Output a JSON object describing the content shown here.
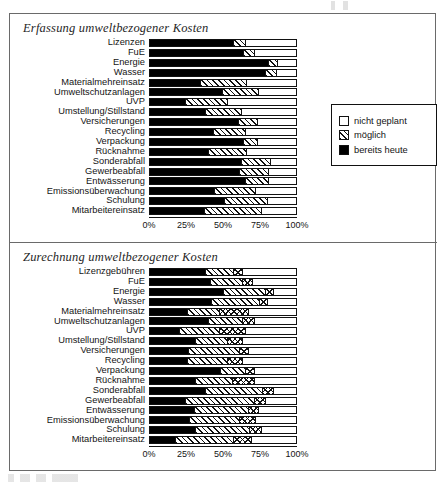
{
  "document": {
    "frame": "scanned-figure-border",
    "accent_color": "#000000",
    "paper_color": "#ffffff"
  },
  "charts": [
    {
      "id": "erfassung",
      "title": "Erfassung umweltbezogener Kosten",
      "legend": {
        "position": "right",
        "items": [
          {
            "label": "nicht geplant",
            "fill": "empty"
          },
          {
            "label": "möglich",
            "fill": "hatch"
          },
          {
            "label": "bereits heute",
            "fill": "solid"
          }
        ]
      },
      "axis": {
        "ticks": [
          "0%",
          "25%",
          "50%",
          "75%",
          "100%"
        ],
        "values": [
          0,
          25,
          50,
          75,
          100
        ]
      }
    },
    {
      "id": "zurechnung",
      "title": "Zurechnung  umweltbezogener Kosten",
      "legend": {
        "position": "right",
        "items": [
          {
            "label": "nicht geplant",
            "fill": "empty"
          },
          {
            "label": "bisher noch nicht",
            "fill": "cross"
          },
          {
            "label": "pauschal",
            "fill": "hatch"
          },
          {
            "label": "verursachungsgerecht",
            "fill": "solid"
          }
        ]
      },
      "axis": {
        "ticks": [
          "0%",
          "25%",
          "50%",
          "75%",
          "100%"
        ],
        "values": [
          0,
          25,
          50,
          75,
          100
        ]
      }
    }
  ],
  "chart_data": [
    {
      "type": "bar",
      "orientation": "horizontal",
      "stacked": true,
      "stacked_percent": true,
      "title": "Erfassung umweltbezogener Kosten",
      "xlabel": "",
      "ylabel": "",
      "xlim": [
        0,
        100
      ],
      "grid": false,
      "legend_position": "right",
      "tick_labels": [
        "0%",
        "25%",
        "50%",
        "75%",
        "100%"
      ],
      "categories": [
        "Lizenzen",
        "FuE",
        "Energie",
        "Wasser",
        "Materialmehreinsatz",
        "Umweltschutzanlagen",
        "UVP",
        "Umstellung/Stillstand",
        "Versicherungen",
        "Recycling",
        "Verpackung",
        "Rücknahme",
        "Sonderabfall",
        "Gewerbeabfall",
        "Entwässerung",
        "Emissionsüberwachung",
        "Schulung",
        "Mitarbeitereinsatz"
      ],
      "series": [
        {
          "name": "bereits heute",
          "fill": "solid",
          "values": [
            57,
            64,
            81,
            79,
            34,
            49,
            24,
            38,
            60,
            43,
            64,
            40,
            62,
            61,
            65,
            44,
            51,
            37
          ]
        },
        {
          "name": "möglich",
          "fill": "hatch",
          "values": [
            8,
            7,
            6,
            7,
            32,
            25,
            29,
            24,
            13,
            22,
            9,
            26,
            20,
            20,
            16,
            28,
            29,
            39
          ]
        },
        {
          "name": "nicht geplant",
          "fill": "empty",
          "values": [
            35,
            29,
            13,
            14,
            34,
            26,
            47,
            38,
            27,
            35,
            27,
            34,
            18,
            19,
            19,
            28,
            20,
            24
          ]
        }
      ]
    },
    {
      "type": "bar",
      "orientation": "horizontal",
      "stacked": true,
      "stacked_percent": true,
      "title": "Zurechnung  umweltbezogener Kosten",
      "xlabel": "",
      "ylabel": "",
      "xlim": [
        0,
        100
      ],
      "grid": false,
      "legend_position": "right",
      "tick_labels": [
        "0%",
        "25%",
        "50%",
        "75%",
        "100%"
      ],
      "categories": [
        "Lizenzgebühren",
        "FuE",
        "Energie",
        "Wasser",
        "Materialmehreinsatz",
        "Umweltschutzanlagen",
        "UVP",
        "Umstellung/Stillstand",
        "Versicherungen",
        "Recycling",
        "Verpackung",
        "Rücknahme",
        "Sonderabfall",
        "Gewerbeabfall",
        "Entwässerung",
        "Emissionsüberwachung",
        "Schulung",
        "Mitarbeitereinsatz"
      ],
      "series": [
        {
          "name": "verursachungsgerecht",
          "fill": "solid",
          "values": [
            38,
            41,
            50,
            42,
            25,
            40,
            20,
            31,
            26,
            25,
            48,
            31,
            38,
            24,
            30,
            27,
            31,
            17
          ]
        },
        {
          "name": "pauschal",
          "fill": "hatch",
          "values": [
            19,
            22,
            29,
            33,
            22,
            23,
            27,
            22,
            35,
            28,
            17,
            25,
            39,
            47,
            37,
            34,
            37,
            40
          ]
        },
        {
          "name": "bisher noch nicht",
          "fill": "cross",
          "values": [
            6,
            7,
            5,
            5,
            20,
            8,
            18,
            10,
            6,
            10,
            6,
            15,
            7,
            8,
            7,
            11,
            8,
            12
          ]
        },
        {
          "name": "nicht geplant",
          "fill": "empty",
          "values": [
            37,
            30,
            16,
            20,
            33,
            29,
            35,
            37,
            33,
            37,
            29,
            29,
            16,
            21,
            26,
            28,
            24,
            31
          ]
        }
      ]
    }
  ]
}
